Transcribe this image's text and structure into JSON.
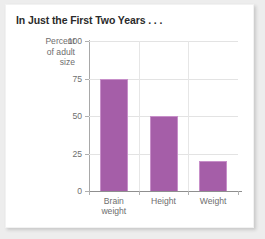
{
  "card": {
    "title": "In Just the First Two Years . . ."
  },
  "chart_data": {
    "type": "bar",
    "title": "In Just the First Two Years . . .",
    "xlabel": "",
    "ylabel": "Percent of adult size",
    "ylabel_lines": [
      "Percent",
      "of adult",
      "size"
    ],
    "categories": [
      "Brain weight",
      "Height",
      "Weight"
    ],
    "category_lines": [
      [
        "Brain",
        "weight"
      ],
      [
        "Height"
      ],
      [
        "Weight"
      ]
    ],
    "values": [
      75,
      50,
      20
    ],
    "ylim": [
      0,
      100
    ],
    "yticks": [
      0,
      25,
      50,
      75,
      100
    ],
    "ytick_labels": [
      "0",
      "25",
      "50",
      "75",
      "100"
    ],
    "grid": "horizontal-and-vertical",
    "legend": "none",
    "bar_color": "#a55ea8",
    "bar_edge_color": "#c78fc9",
    "gridline_color": "#e3e3e3",
    "axis_color": "#8f8f8f",
    "text_color": "#6e6e6e",
    "title_color": "#2b2b2b",
    "page_background": "#ededed",
    "card_background": "#ffffff"
  }
}
